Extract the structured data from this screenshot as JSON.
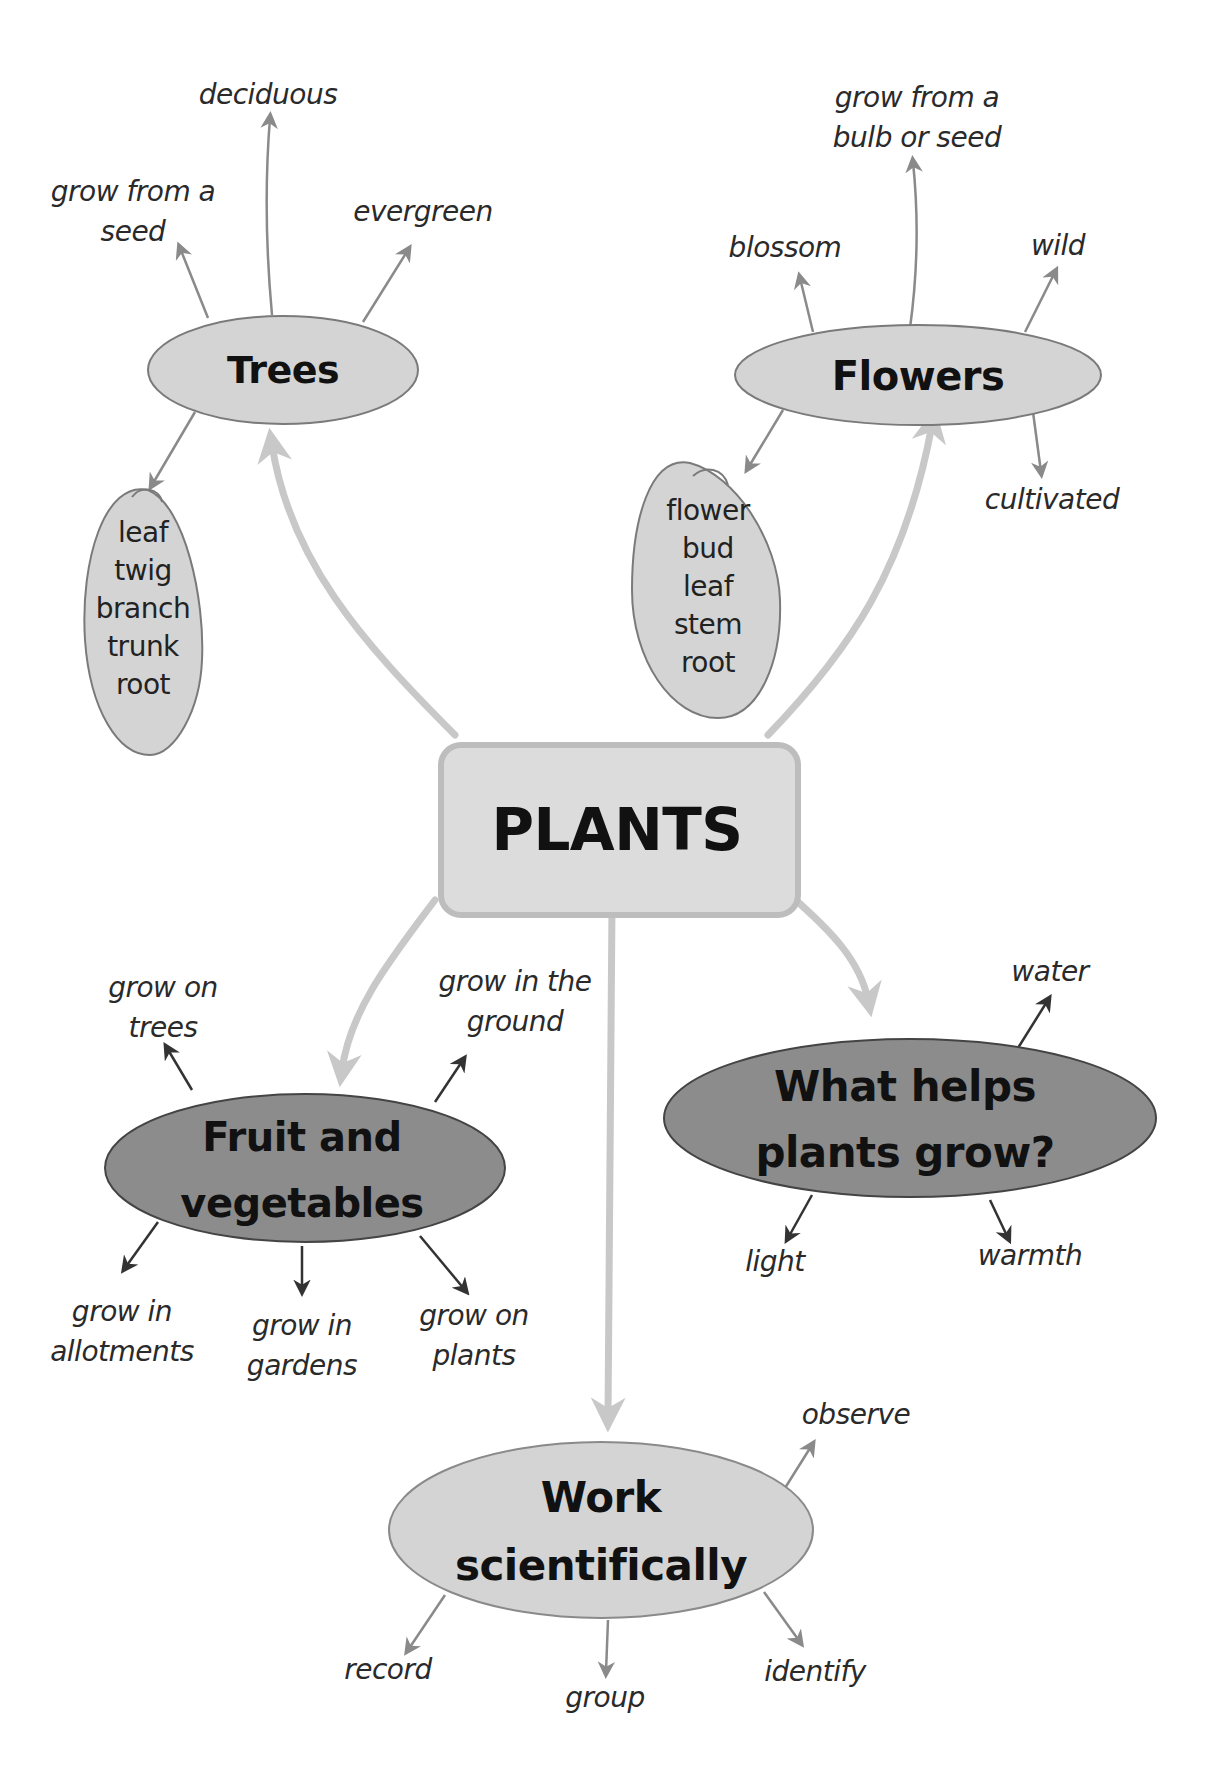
{
  "colors": {
    "light_node": "#d4d4d4",
    "dark_node": "#8c8c8c",
    "center_fill": "#dcdcdc",
    "center_border": "#bdbdbd",
    "main_connector": "#c8c8c8",
    "light_arrow": "#8a8a8a",
    "dark_arrow": "#333333",
    "outline": "#7a7a7a"
  },
  "center": {
    "title": "PLANTS"
  },
  "trees": {
    "title": "Trees",
    "branches": [
      "deciduous",
      "grow from a\nseed",
      "evergreen"
    ],
    "parts": [
      "leaf",
      "twig",
      "branch",
      "trunk",
      "root"
    ]
  },
  "flowers": {
    "title": "Flowers",
    "branches": [
      "grow from a\nbulb or seed",
      "blossom",
      "wild",
      "cultivated"
    ],
    "parts": [
      "flower",
      "bud",
      "leaf",
      "stem",
      "root"
    ]
  },
  "fruit_veg": {
    "title": "Fruit and\nvegetables",
    "branches": [
      "grow on\ntrees",
      "grow in the\nground",
      "grow in\nallotments",
      "grow in\ngardens",
      "grow on\nplants"
    ]
  },
  "helps_grow": {
    "title": "What helps\nplants grow?",
    "branches": [
      "water",
      "light",
      "warmth"
    ]
  },
  "work_sci": {
    "title": "Work\nscientifically",
    "branches": [
      "observe",
      "record",
      "group",
      "identify"
    ]
  }
}
